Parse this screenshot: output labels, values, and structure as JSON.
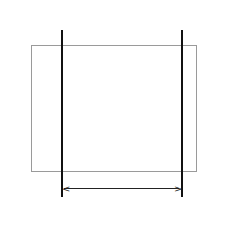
{
  "repeat_label": "8 sts",
  "columns": 11,
  "repeat_start_col": 3,
  "repeat_end_col": 10,
  "left_labels": [
    "16",
    "14",
    "12",
    "10",
    "8",
    "6",
    "4",
    "2"
  ],
  "right_labels": [
    "15",
    "13",
    "11",
    "9",
    "7",
    "5",
    "3",
    "1"
  ],
  "rows": [
    {
      "left": "16",
      "right": "15",
      "filled": [
        2,
        6,
        10
      ]
    },
    {
      "left": "14",
      "right": "13",
      "filled": [
        1,
        2,
        5,
        6,
        7,
        8,
        9,
        10,
        11
      ]
    },
    {
      "left": "12",
      "right": "11",
      "filled": [
        5,
        6,
        7
      ]
    },
    {
      "left": "10",
      "right": "9",
      "filled": [
        1,
        2,
        3,
        4,
        5,
        6,
        7,
        10,
        11
      ]
    },
    {
      "left": "8",
      "right": "7",
      "filled": [
        2,
        6,
        10
      ]
    },
    {
      "left": "6",
      "right": "5",
      "filled": [
        1,
        2,
        3,
        6,
        7,
        8,
        9,
        10,
        11
      ]
    },
    {
      "left": "4",
      "right": "3",
      "filled": [
        2,
        3,
        9,
        10
      ]
    },
    {
      "left": "2",
      "right": "1",
      "filled": [
        1,
        2,
        3,
        4,
        5,
        6,
        9,
        10,
        11
      ]
    }
  ],
  "colors": {
    "filled": "#111111",
    "grid_line": "#a8a8a8",
    "background": "#ffffff"
  }
}
